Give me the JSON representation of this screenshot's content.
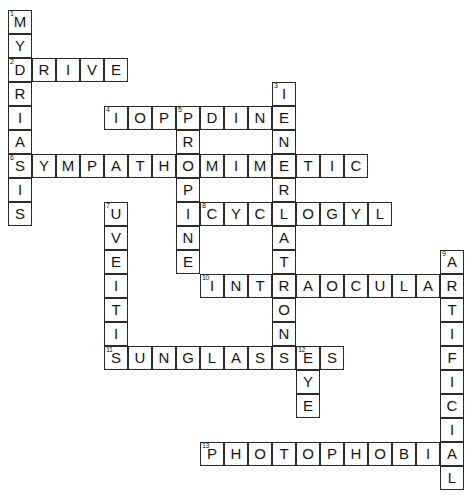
{
  "puzzle": {
    "title": "Crossword Puzzle",
    "cell_size": 24,
    "origin_x": 8,
    "origin_y": 10,
    "grid_color": "#2b2b2b",
    "letter_color": "#141414",
    "background": "#ffffff",
    "entries": [
      {
        "number": "1",
        "answer": "MYDRIASIS",
        "direction": "down",
        "row": 0,
        "col": 0
      },
      {
        "number": "2",
        "answer": "DRIVE",
        "direction": "across",
        "row": 2,
        "col": 0
      },
      {
        "number": "3",
        "answer": "INNERVATION",
        "direction": "down",
        "row": 3,
        "col": 11
      },
      {
        "number": "4",
        "answer": "IOPIDINE",
        "direction": "across",
        "row": 4,
        "col": 4
      },
      {
        "number": "5",
        "answer": "PROPINE",
        "direction": "down",
        "row": 4,
        "col": 7
      },
      {
        "number": "6",
        "answer": "SYMPATHOMIMETIC",
        "direction": "across",
        "row": 6,
        "col": 0
      },
      {
        "number": "7",
        "answer": "UVEITIS",
        "direction": "down",
        "row": 8,
        "col": 4
      },
      {
        "number": "8",
        "answer": "CYCLOGYL",
        "direction": "across",
        "row": 8,
        "col": 8
      },
      {
        "number": "9",
        "answer": "ARTIFICIAL",
        "direction": "down",
        "row": 10,
        "col": 18
      },
      {
        "number": "10",
        "answer": "INTRAOCULAR",
        "direction": "across",
        "row": 11,
        "col": 8
      },
      {
        "number": "11",
        "answer": "SUNGLASSES",
        "direction": "across",
        "row": 14,
        "col": 4
      },
      {
        "number": "12",
        "answer": "EYE",
        "direction": "down",
        "row": 14,
        "col": 12
      },
      {
        "number": "13",
        "answer": "PHOTOPHOBIA",
        "direction": "across",
        "row": 18,
        "col": 8
      }
    ]
  }
}
